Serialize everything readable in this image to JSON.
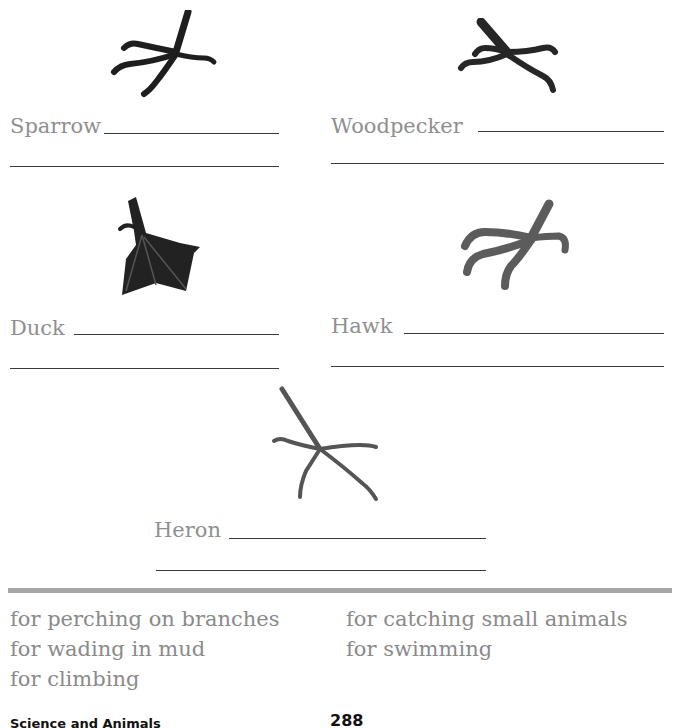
{
  "worksheet": {
    "birds": [
      {
        "name": "Sparrow",
        "icon": "sparrow-foot-icon"
      },
      {
        "name": "Woodpecker",
        "icon": "woodpecker-foot-icon"
      },
      {
        "name": "Duck",
        "icon": "duck-foot-icon"
      },
      {
        "name": "Hawk",
        "icon": "hawk-foot-icon"
      },
      {
        "name": "Heron",
        "icon": "heron-foot-icon"
      }
    ],
    "answer_options": {
      "left": [
        "for perching on branches",
        "for wading in mud",
        "for climbing"
      ],
      "right": [
        "for catching small animals",
        "for swimming"
      ]
    }
  },
  "footer": {
    "section": "Science and Animals",
    "page_number": "288"
  }
}
